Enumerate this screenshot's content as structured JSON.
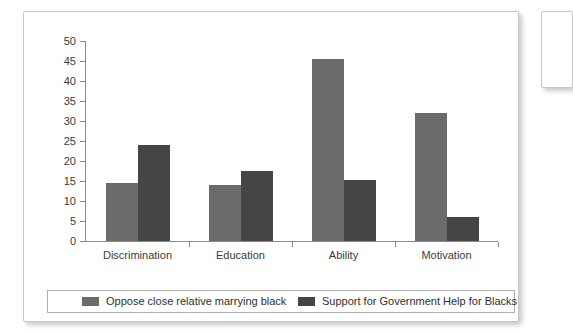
{
  "chart_data": {
    "type": "bar",
    "title": "",
    "xlabel": "",
    "ylabel": "",
    "ylim": [
      0,
      50
    ],
    "yticks": [
      0,
      5,
      10,
      15,
      20,
      25,
      30,
      35,
      40,
      45,
      50
    ],
    "grid": false,
    "legend_position": "bottom",
    "categories": [
      "Discrimination",
      "Education",
      "Ability",
      "Motivation"
    ],
    "series": [
      {
        "name": "Oppose close relative marrying black",
        "color": "#6b6b6b",
        "values": [
          14.5,
          14.0,
          45.5,
          32.0
        ]
      },
      {
        "name": "Support for Government Help for Blacks",
        "color": "#454545",
        "values": [
          24.0,
          17.5,
          15.2,
          6.0
        ]
      }
    ]
  },
  "legend": {
    "entries": [
      {
        "label": "Oppose close relative marrying black",
        "swatch": "#6b6b6b"
      },
      {
        "label": "Support for Government Help for Blacks",
        "swatch": "#454545"
      }
    ]
  },
  "colors": {
    "series_light": "#6b6b6b",
    "series_dark": "#454545",
    "axis": "#8a8a8a",
    "text": "#3b3b3b",
    "panel_border": "#c9c9c9",
    "legend_border": "#adadad",
    "page_background": "#ffffff"
  }
}
